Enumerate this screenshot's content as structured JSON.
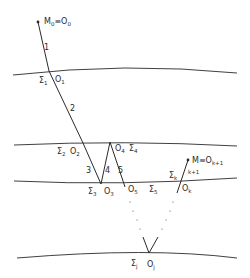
{
  "diagram": {
    "colors": {
      "line": "#2a2a2a",
      "background": "#ffffff"
    },
    "start_point": {
      "label": "M",
      "sub": "0",
      "equiv": "≡O",
      "equiv_sub": "0"
    },
    "end_point": {
      "label": "M",
      "equiv": "≡O",
      "equiv_sub": "k+1"
    },
    "interfaces": [
      {
        "id": "sigma1",
        "label": "Σ",
        "sub": "1"
      },
      {
        "id": "sigma2",
        "label": "Σ",
        "sub": "2"
      },
      {
        "id": "sigma3",
        "label": "Σ",
        "sub": "3"
      },
      {
        "id": "sigma4",
        "label": "Σ",
        "sub": "4"
      },
      {
        "id": "sigma5",
        "label": "Σ",
        "sub": "5"
      },
      {
        "id": "sigmak",
        "label": "Σ",
        "sub": "k"
      },
      {
        "id": "sigmaj",
        "label": "Σ",
        "sub": "j"
      }
    ],
    "points": [
      {
        "id": "O1",
        "label": "O",
        "sub": "1"
      },
      {
        "id": "O2",
        "label": "O",
        "sub": "2"
      },
      {
        "id": "O3",
        "label": "O",
        "sub": "3"
      },
      {
        "id": "O4",
        "label": "O",
        "sub": "4"
      },
      {
        "id": "O5",
        "label": "O",
        "sub": "5"
      },
      {
        "id": "Ok",
        "label": "O",
        "sub": "k"
      },
      {
        "id": "Oj",
        "label": "O",
        "sub": "j"
      }
    ],
    "segments": [
      "1",
      "2",
      "3",
      "4",
      "5",
      "k+1"
    ]
  }
}
